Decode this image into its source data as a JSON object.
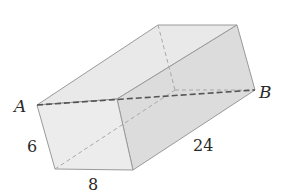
{
  "figure": {
    "type": "rectangular prism",
    "vertex_labels": {
      "a": "A",
      "b": "B"
    },
    "dimension_labels": {
      "height": "6",
      "width": "8",
      "length": "24"
    },
    "colors": {
      "edge": "#9a9a9a",
      "hidden_edge": "#a8a8a8",
      "diagonal": "#555555",
      "front_face": "#ececec",
      "top_face": "#e8e8e8",
      "side_face": "#dadada",
      "text": "#2a2a2a"
    }
  }
}
